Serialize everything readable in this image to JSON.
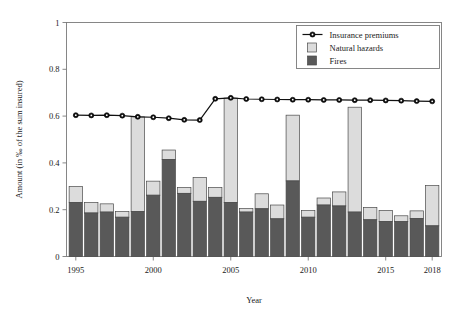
{
  "chart_data": {
    "type": "bar",
    "title": "",
    "subtitle": "",
    "xlabel": "Year",
    "ylabel": "Amount (in ‰ of the sum insured)",
    "xlim": [
      1994.4,
      2018.6
    ],
    "ylim": [
      0,
      1
    ],
    "yticks": [
      0,
      0.2,
      0.4,
      0.6,
      0.8,
      1
    ],
    "ytick_labels": [
      "0",
      "0.2",
      "0.4",
      "0.6",
      "0.8",
      "1"
    ],
    "xticks": [
      1995,
      2000,
      2005,
      2010,
      2015,
      2018
    ],
    "xtick_labels": [
      "1995",
      "2000",
      "2005",
      "2010",
      "2015",
      "2018"
    ],
    "grid": false,
    "stacked": true,
    "legend_position": "top-right",
    "categories": [
      1995,
      1996,
      1997,
      1998,
      1999,
      2000,
      2001,
      2002,
      2003,
      2004,
      2005,
      2006,
      2007,
      2008,
      2009,
      2010,
      2011,
      2012,
      2013,
      2014,
      2015,
      2016,
      2017,
      2018
    ],
    "series": [
      {
        "name": "Fires",
        "type": "bar",
        "color": "#595959",
        "values": [
          0.231,
          0.186,
          0.19,
          0.168,
          0.192,
          0.262,
          0.415,
          0.27,
          0.236,
          0.253,
          0.231,
          0.19,
          0.204,
          0.161,
          0.323,
          0.168,
          0.22,
          0.216,
          0.19,
          0.157,
          0.15,
          0.149,
          0.162,
          0.131
        ]
      },
      {
        "name": "Natural hazards",
        "type": "bar",
        "color": "#dcdcdc",
        "values": [
          0.068,
          0.045,
          0.035,
          0.024,
          0.405,
          0.06,
          0.04,
          0.025,
          0.101,
          0.042,
          0.446,
          0.015,
          0.064,
          0.059,
          0.281,
          0.028,
          0.03,
          0.06,
          0.448,
          0.053,
          0.047,
          0.025,
          0.033,
          0.172
        ]
      },
      {
        "name": "Insurance premiums",
        "type": "line",
        "color": "#111111",
        "marker": "circle",
        "values": [
          0.604,
          0.603,
          0.604,
          0.602,
          0.597,
          0.595,
          0.591,
          0.584,
          0.583,
          0.674,
          0.678,
          0.673,
          0.672,
          0.671,
          0.67,
          0.67,
          0.669,
          0.669,
          0.668,
          0.668,
          0.667,
          0.666,
          0.664,
          0.663
        ]
      }
    ],
    "totals": [
      0.299,
      0.231,
      0.225,
      0.192,
      0.597,
      0.322,
      0.455,
      0.295,
      0.337,
      0.295,
      0.677,
      0.205,
      0.268,
      0.22,
      0.604,
      0.196,
      0.25,
      0.276,
      0.638,
      0.21,
      0.197,
      0.174,
      0.195,
      0.303
    ]
  },
  "legend": {
    "items": [
      {
        "label": "Insurance premiums",
        "marker": "line-circle",
        "color": "#111111"
      },
      {
        "label": "Natural hazards",
        "marker": "swatch",
        "color": "#dcdcdc"
      },
      {
        "label": "Fires",
        "marker": "swatch",
        "color": "#595959"
      }
    ]
  },
  "colors": {
    "fires": "#595959",
    "natural_hazards": "#dcdcdc",
    "premiums": "#111111",
    "axis": "#7a7a7a",
    "bar_edge": "#4a4a4a",
    "background": "#ffffff"
  }
}
